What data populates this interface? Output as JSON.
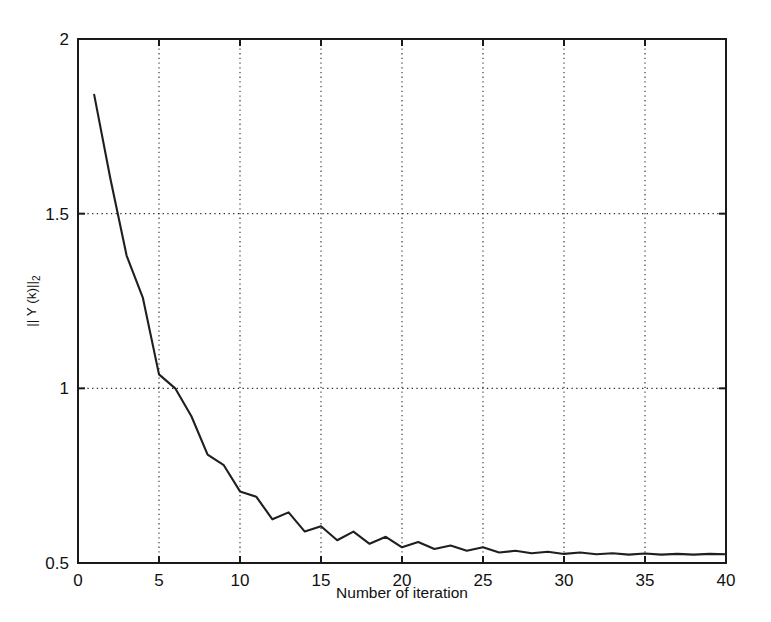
{
  "figure": {
    "background_color": "#ffffff",
    "line_color": "#1f1f1f",
    "axis_color": "#1a1a1a",
    "grid_color": "#2a2a2a"
  },
  "axis": {
    "x_title": "Number of iteration",
    "y_title_main": "|| Y (k)||",
    "y_title_sub": "2",
    "x_ticks": [
      "0",
      "5",
      "10",
      "15",
      "20",
      "25",
      "30",
      "35",
      "40"
    ],
    "y_ticks": [
      "2",
      "1.5",
      "1",
      "0.5"
    ]
  },
  "chart_data": {
    "type": "line",
    "title": "",
    "xlabel": "Number of iteration",
    "ylabel": "|| Y (k)||_2",
    "xlim": [
      0,
      40
    ],
    "ylim": [
      0.5,
      2
    ],
    "xticks": [
      0,
      5,
      10,
      15,
      20,
      25,
      30,
      35,
      40
    ],
    "yticks": [
      0.5,
      1,
      1.5,
      2
    ],
    "grid": true,
    "legend": false,
    "series": [
      {
        "name": "|| Y (k)||_2",
        "x": [
          1,
          2,
          3,
          4,
          5,
          6,
          7,
          8,
          9,
          10,
          11,
          12,
          13,
          14,
          15,
          16,
          17,
          18,
          19,
          20,
          21,
          22,
          23,
          24,
          25,
          26,
          27,
          28,
          29,
          30,
          31,
          32,
          33,
          34,
          35,
          36,
          37,
          38,
          39,
          40
        ],
        "y": [
          1.84,
          1.6,
          1.38,
          1.26,
          1.04,
          1.0,
          0.92,
          0.81,
          0.78,
          0.705,
          0.69,
          0.625,
          0.645,
          0.59,
          0.605,
          0.565,
          0.59,
          0.555,
          0.575,
          0.545,
          0.56,
          0.54,
          0.55,
          0.535,
          0.545,
          0.53,
          0.535,
          0.528,
          0.532,
          0.526,
          0.53,
          0.525,
          0.528,
          0.524,
          0.527,
          0.524,
          0.526,
          0.524,
          0.526,
          0.525
        ]
      }
    ]
  }
}
